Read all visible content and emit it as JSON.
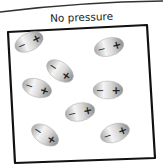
{
  "title": "No pressure",
  "colors": {
    "frame": "#111111",
    "dipole_light": "#f2f2f2",
    "dipole_dark": "#9a9a9a",
    "sign": "#222222"
  },
  "dipoles": [
    {
      "cx": 29,
      "cy": 42,
      "angle": -25,
      "negative": "−",
      "positive": "+"
    },
    {
      "cx": 109,
      "cy": 47,
      "angle": -15,
      "negative": "−",
      "positive": "+"
    },
    {
      "cx": 60,
      "cy": 71,
      "angle": 35,
      "negative": "−",
      "positive": "+"
    },
    {
      "cx": 37,
      "cy": 88,
      "angle": 18,
      "negative": "−",
      "positive": "+"
    },
    {
      "cx": 108,
      "cy": 90,
      "angle": 0,
      "negative": "−",
      "positive": "+"
    },
    {
      "cx": 80,
      "cy": 112,
      "angle": -12,
      "negative": "−",
      "positive": "+"
    },
    {
      "cx": 45,
      "cy": 135,
      "angle": 33,
      "negative": "−",
      "positive": "+"
    },
    {
      "cx": 115,
      "cy": 133,
      "angle": -20,
      "negative": "−",
      "positive": "+"
    }
  ]
}
